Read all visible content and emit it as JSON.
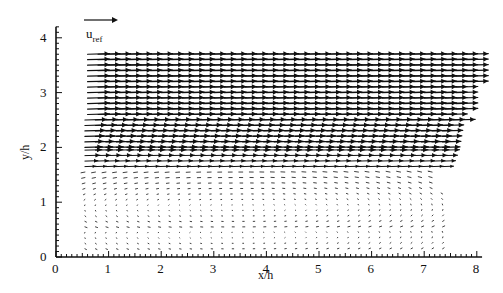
{
  "chart_data": {
    "type": "quiver",
    "title": "",
    "xlabel": "x/h",
    "ylabel": "y/h",
    "xlim": [
      0,
      8
    ],
    "ylim": [
      0,
      4.2
    ],
    "x_ticks": [
      "0",
      "1",
      "2",
      "3",
      "4",
      "5",
      "6",
      "7",
      "8"
    ],
    "y_ticks": [
      "0",
      "1",
      "2",
      "3",
      "4"
    ],
    "grid": false,
    "legend": {
      "reference_vector_label": "u",
      "reference_vector_subscript": "ref",
      "position": "top-left above field"
    },
    "field": {
      "x_range": [
        0.55,
        8.0
      ],
      "y_range": [
        0.1,
        3.75
      ],
      "regions": [
        {
          "name": "free-stream",
          "y_range": [
            2.0,
            3.75
          ],
          "direction": "rightward",
          "magnitude": "high (~u_ref)"
        },
        {
          "name": "shear-layer",
          "y_range": [
            1.6,
            2.0
          ],
          "direction": "rightward",
          "magnitude": "medium"
        },
        {
          "name": "recirculation",
          "y_range": [
            0.1,
            1.6
          ],
          "x_range": [
            0.55,
            7.4
          ],
          "direction": "mixed / weak, slightly leftward near bottom",
          "magnitude": "low"
        }
      ]
    },
    "annotations": [
      "u_ref reference arrow"
    ]
  },
  "labels": {
    "x_title": "x/h",
    "y_title": "y/h",
    "uref_main": "u",
    "uref_sub": "ref"
  }
}
